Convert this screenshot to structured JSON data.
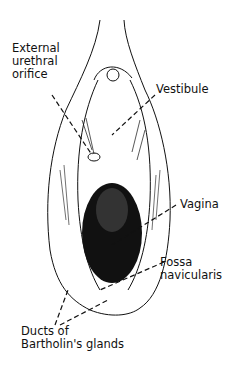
{
  "figure": {
    "type": "anatomical line drawing",
    "labels": [
      {
        "id": "external-urethral-orifice",
        "text": "External\nurethral\norifice"
      },
      {
        "id": "vestibule",
        "text": "Vestibule"
      },
      {
        "id": "vagina",
        "text": "Vagina"
      },
      {
        "id": "fossa-navicularis",
        "text": "Fossa\nnavicularis"
      },
      {
        "id": "ducts-of-bartholins-glands",
        "text": "Ducts of\nBartholin's glands"
      }
    ]
  }
}
